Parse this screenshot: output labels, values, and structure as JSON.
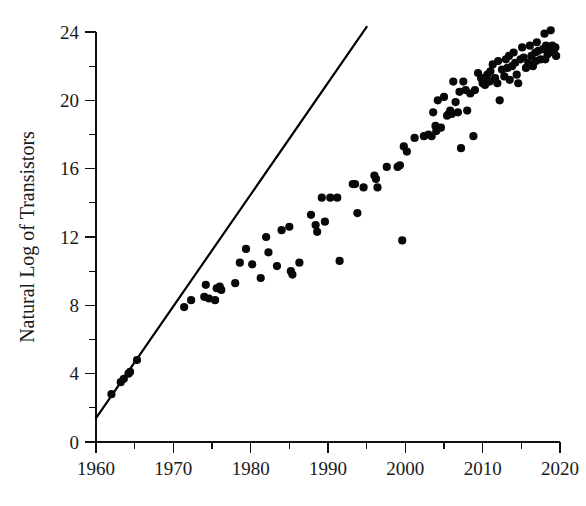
{
  "chart_data": {
    "type": "scatter",
    "title": "",
    "subtitle": "",
    "xlabel": "",
    "ylabel": "Natural Log of Transistors",
    "xlim": [
      1960,
      2020
    ],
    "ylim": [
      0,
      24
    ],
    "grid": false,
    "legend": null,
    "x_ticks": [
      1960,
      1970,
      1980,
      1990,
      2000,
      2010,
      2020
    ],
    "x_tick_labels": [
      "1960",
      "1970",
      "1980",
      "1990",
      "2000",
      "2010",
      "2020"
    ],
    "x_minor_ticks": [
      1965,
      1975,
      1985,
      1995,
      2005,
      2015
    ],
    "y_ticks": [
      0,
      4,
      8,
      12,
      16,
      20,
      24
    ],
    "y_tick_labels": [
      "0",
      "4",
      "8",
      "12",
      "16",
      "20",
      "24"
    ],
    "y_minor_ticks": [
      2,
      6,
      10,
      14,
      18,
      22
    ],
    "series": [
      {
        "name": "Transistor counts",
        "type": "scatter",
        "marker": "circle",
        "color": "#080808",
        "marker_size": 7,
        "points": [
          [
            1962.0,
            2.8
          ],
          [
            1963.2,
            3.5
          ],
          [
            1963.6,
            3.7
          ],
          [
            1964.2,
            4.0
          ],
          [
            1964.4,
            4.1
          ],
          [
            1965.3,
            4.8
          ],
          [
            1971.4,
            7.9
          ],
          [
            1972.3,
            8.3
          ],
          [
            1974.0,
            8.5
          ],
          [
            1974.2,
            9.2
          ],
          [
            1974.6,
            8.4
          ],
          [
            1975.4,
            8.3
          ],
          [
            1975.6,
            9.0
          ],
          [
            1976.0,
            9.1
          ],
          [
            1976.2,
            8.9
          ],
          [
            1978.0,
            9.3
          ],
          [
            1978.6,
            10.5
          ],
          [
            1979.4,
            11.3
          ],
          [
            1980.2,
            10.4
          ],
          [
            1981.3,
            9.6
          ],
          [
            1982.0,
            12.0
          ],
          [
            1982.3,
            11.1
          ],
          [
            1983.4,
            10.3
          ],
          [
            1984.0,
            12.4
          ],
          [
            1985.0,
            12.6
          ],
          [
            1985.2,
            10.0
          ],
          [
            1985.4,
            9.8
          ],
          [
            1986.3,
            10.5
          ],
          [
            1987.8,
            13.3
          ],
          [
            1988.4,
            12.7
          ],
          [
            1988.6,
            12.3
          ],
          [
            1989.2,
            14.3
          ],
          [
            1989.6,
            12.9
          ],
          [
            1990.3,
            14.3
          ],
          [
            1991.2,
            14.3
          ],
          [
            1991.5,
            10.6
          ],
          [
            1993.2,
            15.1
          ],
          [
            1993.5,
            15.1
          ],
          [
            1993.8,
            13.4
          ],
          [
            1994.6,
            14.9
          ],
          [
            1996.0,
            15.6
          ],
          [
            1996.2,
            15.4
          ],
          [
            1996.4,
            14.9
          ],
          [
            1997.6,
            16.1
          ],
          [
            1999.0,
            16.1
          ],
          [
            1999.3,
            16.2
          ],
          [
            1999.6,
            11.8
          ],
          [
            1999.8,
            17.3
          ],
          [
            2000.2,
            17.0
          ],
          [
            2001.2,
            17.8
          ],
          [
            2002.4,
            17.9
          ],
          [
            2003.0,
            18.0
          ],
          [
            2003.4,
            17.9
          ],
          [
            2003.6,
            19.3
          ],
          [
            2003.9,
            18.5
          ],
          [
            2004.2,
            20.0
          ],
          [
            2004.6,
            18.4
          ],
          [
            2005.0,
            20.2
          ],
          [
            2005.4,
            19.1
          ],
          [
            2005.6,
            19.2
          ],
          [
            2005.8,
            19.4
          ],
          [
            2006.0,
            19.2
          ],
          [
            2006.2,
            21.1
          ],
          [
            2006.5,
            19.9
          ],
          [
            2006.8,
            19.3
          ],
          [
            2007.0,
            20.5
          ],
          [
            2007.2,
            17.2
          ],
          [
            2007.5,
            21.1
          ],
          [
            2007.8,
            20.6
          ],
          [
            2008.0,
            19.4
          ],
          [
            2008.4,
            20.4
          ],
          [
            2008.8,
            17.9
          ],
          [
            2009.0,
            20.6
          ],
          [
            2009.4,
            21.6
          ],
          [
            2009.8,
            21.3
          ],
          [
            2010.0,
            21.0
          ],
          [
            2010.3,
            20.9
          ],
          [
            2010.6,
            21.5
          ],
          [
            2010.9,
            21.1
          ],
          [
            2011.0,
            21.7
          ],
          [
            2011.3,
            22.1
          ],
          [
            2011.6,
            21.3
          ],
          [
            2011.9,
            21.0
          ],
          [
            2012.0,
            22.3
          ],
          [
            2012.2,
            20.0
          ],
          [
            2012.5,
            21.8
          ],
          [
            2012.8,
            21.4
          ],
          [
            2013.0,
            22.4
          ],
          [
            2013.2,
            21.9
          ],
          [
            2013.5,
            21.2
          ],
          [
            2013.8,
            22.0
          ],
          [
            2014.0,
            22.8
          ],
          [
            2014.2,
            22.2
          ],
          [
            2014.4,
            21.5
          ],
          [
            2014.6,
            21.0
          ],
          [
            2014.9,
            22.4
          ],
          [
            2015.1,
            23.1
          ],
          [
            2015.3,
            22.5
          ],
          [
            2015.6,
            21.9
          ],
          [
            2015.9,
            22.2
          ],
          [
            2016.1,
            23.2
          ],
          [
            2016.3,
            22.6
          ],
          [
            2016.5,
            22.0
          ],
          [
            2016.8,
            22.8
          ],
          [
            2017.0,
            23.4
          ],
          [
            2017.2,
            22.9
          ],
          [
            2017.5,
            22.4
          ],
          [
            2017.8,
            23.0
          ],
          [
            2018.0,
            23.9
          ],
          [
            2018.2,
            23.2
          ],
          [
            2018.4,
            22.7
          ],
          [
            2018.6,
            23.1
          ],
          [
            2018.8,
            24.1
          ],
          [
            2019.0,
            23.2
          ],
          [
            2019.2,
            22.8
          ],
          [
            2019.4,
            23.1
          ],
          [
            2019.5,
            22.6
          ],
          [
            2004.0,
            18.2
          ],
          [
            2010.1,
            21.3
          ],
          [
            2013.4,
            22.6
          ],
          [
            2016.9,
            22.3
          ],
          [
            2018.1,
            22.4
          ]
        ]
      }
    ],
    "reference_line": {
      "name": "Moore's Law reference line",
      "color": "#000000",
      "start": [
        1960,
        1.4
      ],
      "end": [
        1995,
        24.3
      ]
    },
    "annotations": []
  }
}
